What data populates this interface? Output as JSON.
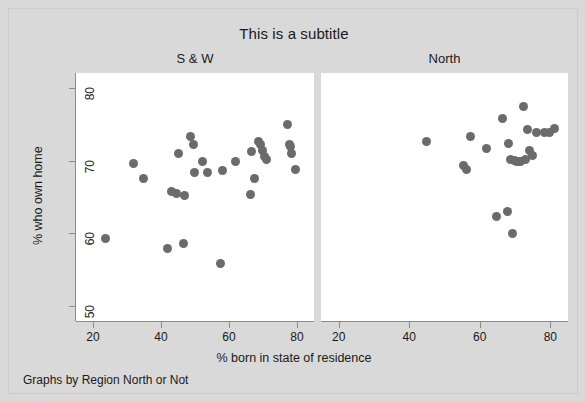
{
  "chart_data": {
    "type": "scatter",
    "title": "This is a subtitle",
    "xlabel": "% born in state of residence",
    "ylabel": "% who own home",
    "note": "Graphs by Region North or Not",
    "xlim": [
      15,
      85
    ],
    "ylim": [
      48,
      82
    ],
    "xticks": [
      20,
      40,
      60,
      80
    ],
    "yticks": [
      50,
      60,
      70,
      80
    ],
    "grid": false,
    "legend": "none",
    "marker_color": "#6b6b6b",
    "panel_background": "#ffffff",
    "figure_background": "#d9d9d9",
    "panels": [
      {
        "label": "S & W",
        "points": [
          {
            "x": 23.8,
            "y": 59.3
          },
          {
            "x": 31.8,
            "y": 69.6
          },
          {
            "x": 34.8,
            "y": 67.6
          },
          {
            "x": 42.0,
            "y": 58.0
          },
          {
            "x": 43.2,
            "y": 65.8
          },
          {
            "x": 44.6,
            "y": 65.5
          },
          {
            "x": 45.2,
            "y": 70.9
          },
          {
            "x": 46.6,
            "y": 58.6
          },
          {
            "x": 47.0,
            "y": 65.2
          },
          {
            "x": 48.8,
            "y": 73.3
          },
          {
            "x": 49.6,
            "y": 72.2
          },
          {
            "x": 49.8,
            "y": 68.4
          },
          {
            "x": 52.2,
            "y": 69.9
          },
          {
            "x": 53.6,
            "y": 68.3
          },
          {
            "x": 57.6,
            "y": 55.9
          },
          {
            "x": 58.2,
            "y": 68.7
          },
          {
            "x": 62.0,
            "y": 69.9
          },
          {
            "x": 66.2,
            "y": 65.4
          },
          {
            "x": 66.6,
            "y": 71.3
          },
          {
            "x": 67.6,
            "y": 67.6
          },
          {
            "x": 68.8,
            "y": 72.6
          },
          {
            "x": 69.2,
            "y": 72.2
          },
          {
            "x": 69.8,
            "y": 71.4
          },
          {
            "x": 70.4,
            "y": 70.6
          },
          {
            "x": 71.0,
            "y": 70.2
          },
          {
            "x": 77.2,
            "y": 74.9
          },
          {
            "x": 77.8,
            "y": 72.2
          },
          {
            "x": 78.2,
            "y": 71.9
          },
          {
            "x": 78.4,
            "y": 70.9
          },
          {
            "x": 79.6,
            "y": 68.8
          }
        ]
      },
      {
        "label": "North",
        "points": [
          {
            "x": 44.8,
            "y": 72.6
          },
          {
            "x": 55.4,
            "y": 69.3
          },
          {
            "x": 56.2,
            "y": 68.8
          },
          {
            "x": 57.4,
            "y": 73.3
          },
          {
            "x": 62.0,
            "y": 71.6
          },
          {
            "x": 64.6,
            "y": 62.3
          },
          {
            "x": 66.4,
            "y": 75.8
          },
          {
            "x": 67.8,
            "y": 63.0
          },
          {
            "x": 68.2,
            "y": 72.3
          },
          {
            "x": 68.6,
            "y": 70.2
          },
          {
            "x": 69.4,
            "y": 60.0
          },
          {
            "x": 69.8,
            "y": 70.0
          },
          {
            "x": 70.4,
            "y": 69.9
          },
          {
            "x": 71.0,
            "y": 69.8
          },
          {
            "x": 71.6,
            "y": 69.8
          },
          {
            "x": 72.4,
            "y": 77.4
          },
          {
            "x": 73.0,
            "y": 70.2
          },
          {
            "x": 73.6,
            "y": 74.3
          },
          {
            "x": 74.2,
            "y": 71.4
          },
          {
            "x": 74.8,
            "y": 70.7
          },
          {
            "x": 76.0,
            "y": 73.9
          },
          {
            "x": 78.2,
            "y": 73.9
          },
          {
            "x": 79.8,
            "y": 73.8
          },
          {
            "x": 81.2,
            "y": 74.4
          }
        ]
      }
    ]
  }
}
